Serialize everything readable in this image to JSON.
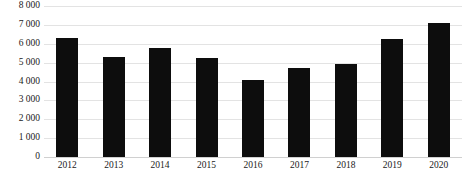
{
  "chart_data": {
    "type": "bar",
    "title": "",
    "xlabel": "",
    "ylabel": "",
    "categories": [
      "2012",
      "2013",
      "2014",
      "2015",
      "2016",
      "2017",
      "2018",
      "2019",
      "2020"
    ],
    "values": [
      6300,
      5300,
      5800,
      5250,
      4100,
      4700,
      4950,
      6250,
      7100
    ],
    "series": [
      {
        "name": "",
        "values": [
          6300,
          5300,
          5800,
          5250,
          4100,
          4700,
          4950,
          6250,
          7100
        ],
        "color": "#0d0d0d"
      }
    ],
    "ylim": [
      0,
      8000
    ],
    "ytick_values": [
      0,
      1000,
      2000,
      3000,
      4000,
      5000,
      6000,
      7000,
      8000
    ],
    "ytick_labels": [
      "0",
      "1 000",
      "2 000",
      "3 000",
      "4 000",
      "5 000",
      "6 000",
      "7 000",
      "8 000"
    ],
    "xtick_labels": [
      "2012",
      "2013",
      "2014",
      "2015",
      "2016",
      "2017",
      "2018",
      "2019",
      "2020"
    ],
    "grid": true,
    "grid_axis": "y",
    "grid_color": "#e3e3e3",
    "legend": false,
    "legend_position": "none",
    "bar_color": "#0d0d0d",
    "background_color": "#ffffff",
    "annotations": []
  },
  "caption": {
    "text": ""
  }
}
